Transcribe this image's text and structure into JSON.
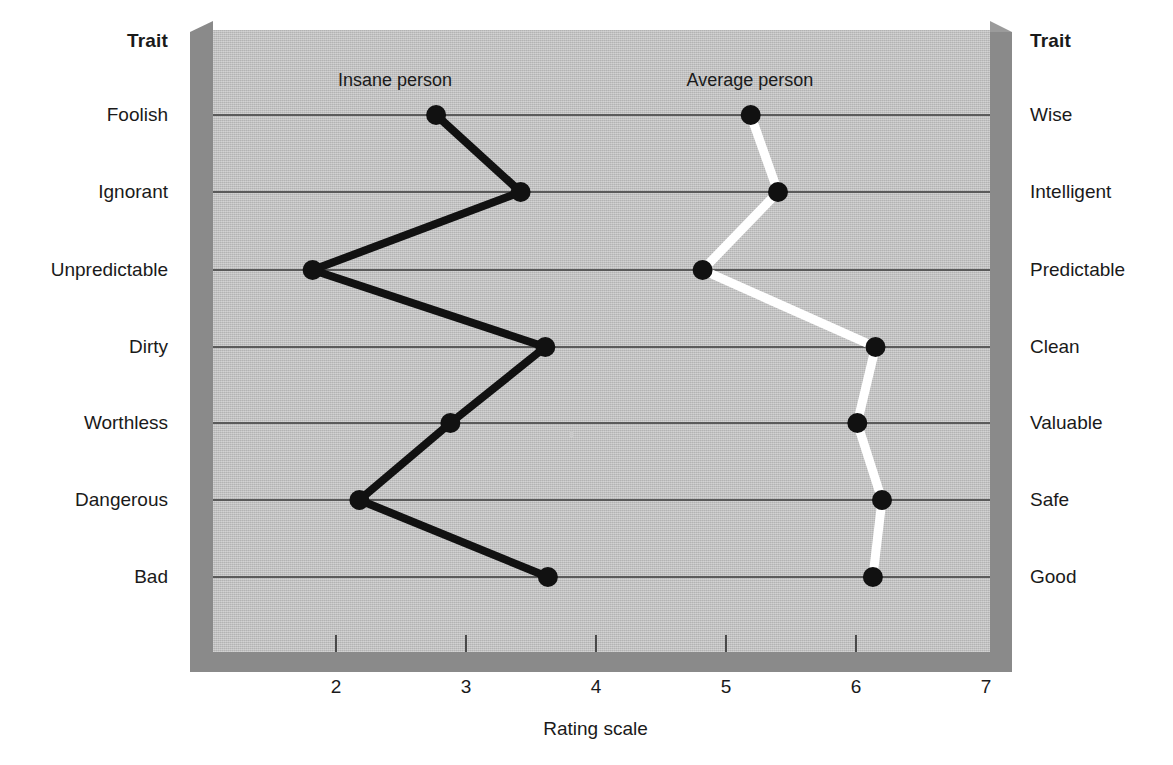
{
  "chart_data": {
    "type": "line",
    "title": "",
    "orientation": "horizontal-profile",
    "xlabel": "Rating scale",
    "ylabel": "",
    "xlim": [
      1,
      7
    ],
    "xticks": [
      2,
      3,
      4,
      5,
      6,
      7
    ],
    "xtick_labels": [
      "2",
      "3",
      "4",
      "5",
      "6",
      "7"
    ],
    "grid": "horizontal",
    "legend_position": "in-plot-top",
    "categories": [
      "Foolish",
      "Ignorant",
      "Unpredictable",
      "Dirty",
      "Worthless",
      "Dangerous",
      "Bad"
    ],
    "categories_right": [
      "Wise",
      "Intelligent",
      "Predictable",
      "Clean",
      "Valuable",
      "Safe",
      "Good"
    ],
    "series": [
      {
        "name": "Insane person",
        "color": "#111111",
        "marker_color": "#111111",
        "values": [
          2.77,
          3.42,
          1.82,
          3.61,
          2.88,
          2.18,
          3.63
        ]
      },
      {
        "name": "Average person",
        "color": "#ffffff",
        "marker_color": "#111111",
        "values": [
          5.19,
          5.4,
          4.82,
          6.15,
          6.01,
          6.2,
          6.13
        ]
      }
    ]
  },
  "headers": {
    "trait_left": "Trait",
    "trait_right": "Trait"
  },
  "axis": {
    "x_title": "Rating scale",
    "tick_labels": [
      "2",
      "3",
      "4",
      "5",
      "6",
      "7"
    ]
  },
  "rows": [
    {
      "left": "Foolish",
      "right": "Wise"
    },
    {
      "left": "Ignorant",
      "right": "Intelligent"
    },
    {
      "left": "Unpredictable",
      "right": "Predictable"
    },
    {
      "left": "Dirty",
      "right": "Clean"
    },
    {
      "left": "Worthless",
      "right": "Valuable"
    },
    {
      "left": "Dangerous",
      "right": "Safe"
    },
    {
      "left": "Bad",
      "right": "Good"
    }
  ],
  "series_labels": {
    "insane": "Insane person",
    "average": "Average person"
  },
  "colors": {
    "plot_background": "#c4c4c4",
    "frame_shadow": "#8a8a8a",
    "gridline": "#5a5a5a",
    "insane_line": "#111111",
    "average_line": "#ffffff",
    "marker": "#111111",
    "page_background": "#ffffff",
    "text": "#1a1a1a"
  }
}
